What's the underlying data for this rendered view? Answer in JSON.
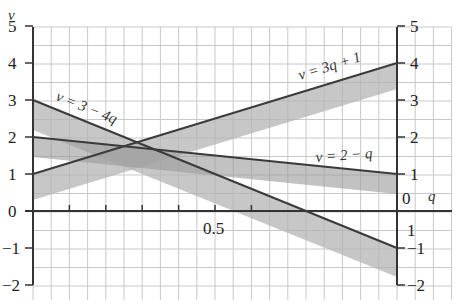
{
  "chart_data": {
    "type": "line",
    "title": "",
    "xlabel": "q",
    "ylabel": "v",
    "xlim": [
      0,
      1
    ],
    "ylim": [
      -2,
      5
    ],
    "grid": true,
    "x_ticks": [
      {
        "value": 0.5,
        "label": "0.5"
      }
    ],
    "y_ticks_left": [
      "5",
      "4",
      "3",
      "2",
      "1",
      "0",
      "−1",
      "−2"
    ],
    "y_ticks_right": [
      "5",
      "4",
      "3",
      "2",
      "1",
      "0",
      "−1",
      "−2"
    ],
    "series": [
      {
        "name": "v = 3q + 1",
        "label": "v = 3q + 1",
        "x": [
          0,
          1
        ],
        "values": [
          1,
          4
        ],
        "band_width": 0.7
      },
      {
        "name": "v = 3 − 4q",
        "label": "v = 3 − 4q",
        "x": [
          0,
          1
        ],
        "values": [
          3,
          -1
        ],
        "band_width": 0.8
      },
      {
        "name": "v = 2 − q",
        "label": "v = 2 − q",
        "x": [
          0,
          1
        ],
        "values": [
          2,
          1
        ],
        "band_width": 0.55
      }
    ],
    "annotations": [
      "v = 3q + 1",
      "v = 3 − 4q",
      "v = 2 − q"
    ]
  },
  "axes": {
    "left_v_label": "v",
    "right_q_label": "q",
    "right_zero": "0",
    "x_tick_label": "0.5",
    "left_ticks": [
      "5",
      "4",
      "3",
      "2",
      "1",
      "0",
      "−1",
      "−2"
    ],
    "right_ticks": [
      "5",
      "4",
      "3",
      "2",
      "1",
      "−1",
      "−2"
    ]
  },
  "labels": {
    "line1": "v = 3q + 1",
    "line2": "v = 3 − 4q",
    "line3": "v = 2 − q"
  }
}
